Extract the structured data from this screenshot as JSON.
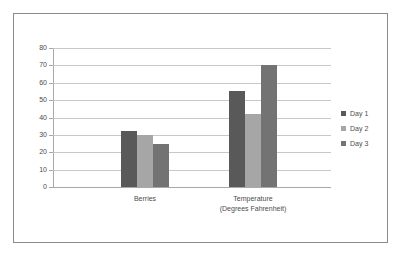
{
  "chart_data": {
    "type": "bar",
    "title": "",
    "subtitle": "",
    "xlabel": "",
    "ylabel": "",
    "categories": [
      "Berries",
      "Temperature (Degrees Fahrenheit)"
    ],
    "category_lines": [
      [
        "Berries"
      ],
      [
        "Temperature",
        "(Degrees Fahrenheit)"
      ]
    ],
    "series": [
      {
        "name": "Day 1",
        "color": "#595959",
        "values": [
          32,
          55
        ]
      },
      {
        "name": "Day 2",
        "color": "#a6a6a6",
        "values": [
          30,
          42
        ]
      },
      {
        "name": "Day 3",
        "color": "#737373",
        "values": [
          24.5,
          70
        ]
      }
    ],
    "ylim": [
      0,
      80
    ],
    "y_ticks": [
      0,
      10,
      20,
      30,
      40,
      50,
      60,
      70,
      80
    ],
    "y_tick_labels": [
      "0",
      "10",
      "20",
      "30",
      "40",
      "50",
      "60",
      "70",
      "80"
    ],
    "grid": true,
    "grid_axis": "y",
    "legend_position": "right",
    "legend_entries": [
      "Day 1",
      "Day 2",
      "Day 3"
    ],
    "gridline_color": "#c8c8c8",
    "axis_color": "#a8a8a8",
    "text_color": "#4c4c4c",
    "plot_background": "#ffffff",
    "frame_border_color": "#8a8a8a"
  }
}
